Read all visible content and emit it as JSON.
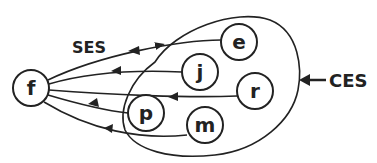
{
  "labels": {
    "ses": "SES",
    "ces": "CES"
  },
  "nodes": {
    "f": "f",
    "e": "e",
    "j": "j",
    "r": "r",
    "p": "p",
    "m": "m"
  },
  "colors": {
    "stroke": "#222222",
    "background": "#ffffff"
  }
}
